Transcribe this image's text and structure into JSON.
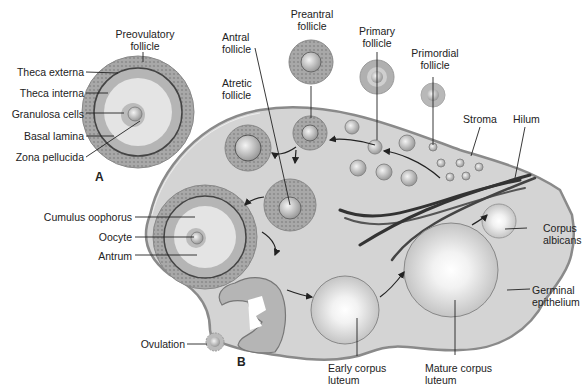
{
  "diagram": {
    "panel_a_letter": "A",
    "panel_b_letter": "B",
    "labels": {
      "preovulatory_1": "Preovulatory",
      "preovulatory_2": "follicle",
      "theca_externa": "Theca externa",
      "theca_interna": "Theca interna",
      "granulosa_cells": "Granulosa cells",
      "basal_lamina": "Basal lamina",
      "zona_pellucida": "Zona pellucida",
      "antral_1": "Antral",
      "antral_2": "follicle",
      "preantral_1": "Preantral",
      "preantral_2": "follicle",
      "primary_1": "Primary",
      "primary_2": "follicle",
      "primordial_1": "Primordial",
      "primordial_2": "follicle",
      "atretic_1": "Atretic",
      "atretic_2": "follicle",
      "stroma": "Stroma",
      "hilum": "Hilum",
      "cumulus_oophorus": "Cumulus oophorus",
      "oocyte": "Oocyte",
      "antrum": "Antrum",
      "corpus_albicans_1": "Corpus",
      "corpus_albicans_2": "albicans",
      "germinal_1": "Germinal",
      "germinal_2": "epithelium",
      "ovulation": "Ovulation",
      "early_cl_1": "Early corpus",
      "early_cl_2": "luteum",
      "mature_cl_1": "Mature corpus",
      "mature_cl_2": "luteum"
    },
    "colors": {
      "ovary_fill": "#d4d4d4",
      "ovary_edge": "#8a8a8a",
      "theca": "#9a9a9a",
      "granulosa": "#b8b8b8",
      "antrum": "#e2e2e2",
      "ink": "#222222"
    }
  }
}
